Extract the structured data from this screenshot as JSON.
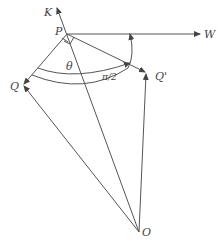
{
  "diagram": {
    "points": {
      "K": {
        "label": "K",
        "x": 57,
        "y": 10
      },
      "P": {
        "label": "P",
        "x": 67,
        "y": 34
      },
      "W": {
        "label": "W",
        "x": 200,
        "y": 34
      },
      "Q": {
        "label": "Q",
        "x": 23,
        "y": 85
      },
      "Q_prime": {
        "label": "Q'",
        "x": 146,
        "y": 73
      },
      "O": {
        "label": "O",
        "x": 139,
        "y": 232
      }
    },
    "angles": {
      "theta": {
        "label": "θ"
      },
      "right_angle": {
        "label": "π/2"
      }
    },
    "edges": [
      {
        "from": "O",
        "to": "K",
        "arrow": true
      },
      {
        "from": "P",
        "to": "W",
        "arrow": true
      },
      {
        "from": "P",
        "to": "Q",
        "arrow": true
      },
      {
        "from": "P",
        "to": "Q_prime",
        "arrow": true
      },
      {
        "from": "O",
        "to": "Q",
        "arrow": true
      },
      {
        "from": "O",
        "to": "Q_prime",
        "arrow": true
      }
    ]
  }
}
